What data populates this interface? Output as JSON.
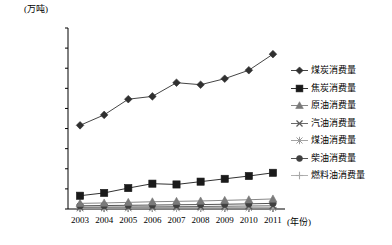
{
  "chart_data": {
    "type": "line",
    "title": "",
    "xlabel": "(年份)",
    "ylabel": "(万吨)",
    "x": [
      2003,
      2004,
      2005,
      2006,
      2007,
      2008,
      2009,
      2010,
      2011
    ],
    "categories": [
      "2003",
      "2004",
      "2005",
      "2006",
      "2007",
      "2008",
      "2009",
      "2010",
      "2011"
    ],
    "ylim": [
      0,
      45000
    ],
    "ytick_values": [
      0,
      5000,
      10000,
      15000,
      20000,
      25000,
      30000,
      35000,
      40000,
      45000
    ],
    "ytick_labels": [
      "0",
      "5000.00",
      "10000.00",
      "15000.00",
      "20000.00",
      "25000.00",
      "30000.00",
      "35000.00",
      "40000.00",
      "45000.00"
    ],
    "grid": false,
    "legend_position": "right",
    "series": [
      {
        "name": "煤炭消费量",
        "marker": "diamond",
        "color": "#303030",
        "values": [
          20800,
          23400,
          27300,
          28000,
          31400,
          30900,
          32400,
          34500,
          38500
        ]
      },
      {
        "name": "焦炭消费量",
        "marker": "square",
        "color": "#1a1a1a",
        "values": [
          3300,
          4000,
          5200,
          6300,
          6100,
          6800,
          7500,
          8200,
          9000
        ]
      },
      {
        "name": "原油消费量",
        "marker": "triangle",
        "color": "#7a7a7a",
        "values": [
          1400,
          1500,
          1650,
          1800,
          1900,
          2000,
          2150,
          2300,
          2500
        ]
      },
      {
        "name": "汽油消费量",
        "marker": "x",
        "color": "#5a5a5a",
        "values": [
          450,
          480,
          510,
          540,
          580,
          620,
          680,
          740,
          800
        ]
      },
      {
        "name": "煤油消费量",
        "marker": "asterisk",
        "color": "#9a9a9a",
        "values": [
          180,
          190,
          200,
          215,
          230,
          240,
          260,
          280,
          300
        ]
      },
      {
        "name": "柴油消费量",
        "marker": "circle",
        "color": "#404040",
        "values": [
          800,
          860,
          920,
          980,
          1050,
          1100,
          1180,
          1280,
          1400
        ]
      },
      {
        "name": "燃料油消费量",
        "marker": "plus",
        "color": "#a8a8a8",
        "values": [
          300,
          320,
          340,
          350,
          360,
          350,
          360,
          380,
          400
        ]
      }
    ]
  },
  "axis": {
    "y_title": "(万吨)",
    "x_title": "(年份)"
  }
}
